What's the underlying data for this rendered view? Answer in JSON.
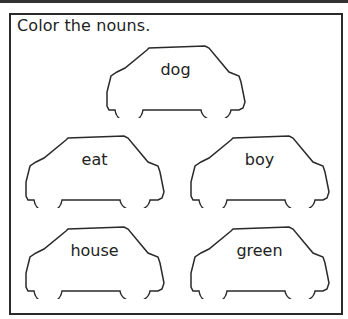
{
  "worksheet": {
    "instruction": "Color the nouns.",
    "cars": [
      {
        "word": "dog"
      },
      {
        "word": "eat"
      },
      {
        "word": "boy"
      },
      {
        "word": "house"
      },
      {
        "word": "green"
      }
    ]
  },
  "colors": {
    "outline": "#2a2a2a",
    "background": "#ffffff"
  }
}
